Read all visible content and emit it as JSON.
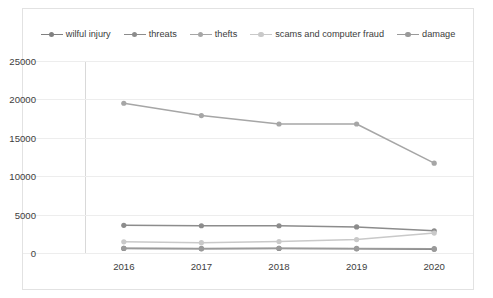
{
  "chart_data": {
    "type": "line",
    "title": "",
    "xlabel": "",
    "ylabel": "",
    "categories": [
      "2016",
      "2017",
      "2018",
      "2019",
      "2020"
    ],
    "x": [
      2016,
      2017,
      2018,
      2019,
      2020
    ],
    "ylim": [
      0,
      25000
    ],
    "yticks": [
      0,
      5000,
      10000,
      15000,
      20000,
      25000
    ],
    "ytick_labels": [
      "0",
      "5000",
      "10000",
      "15000",
      "20000",
      "25000"
    ],
    "grid": true,
    "legend_position": "top",
    "series": [
      {
        "name": "wilful injury",
        "color": "#808080",
        "marker": "circle",
        "values": [
          600,
          550,
          600,
          550,
          500
        ]
      },
      {
        "name": "threats",
        "color": "#8c8c8c",
        "marker": "circle",
        "values": [
          3600,
          3550,
          3550,
          3400,
          2900
        ]
      },
      {
        "name": "thefts",
        "color": "#a6a6a6",
        "marker": "circle",
        "values": [
          19500,
          17900,
          16800,
          16800,
          11700
        ]
      },
      {
        "name": "scams and computer fraud",
        "color": "#c9c9c9",
        "marker": "circle",
        "values": [
          1450,
          1350,
          1500,
          1750,
          2600
        ]
      },
      {
        "name": "damage",
        "color": "#9a9a9a",
        "marker": "circle",
        "values": [
          620,
          600,
          620,
          600,
          560
        ]
      }
    ]
  },
  "legend": {
    "items": [
      {
        "label": "wilful injury"
      },
      {
        "label": "threats"
      },
      {
        "label": "thefts"
      },
      {
        "label": "scams and computer fraud"
      },
      {
        "label": "damage"
      }
    ]
  },
  "axes": {
    "y_tick_labels": [
      "25000",
      "20000",
      "15000",
      "10000",
      "5000",
      "0"
    ],
    "x_tick_labels": [
      "2016",
      "2017",
      "2018",
      "2019",
      "2020"
    ]
  },
  "colors": {
    "grid": "#ededed",
    "frame": "#e2e2e2",
    "text": "#3d3d3d"
  }
}
